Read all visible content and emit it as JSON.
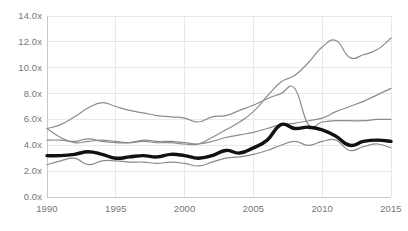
{
  "chart_data": {
    "type": "line",
    "title": "",
    "subtitle": "",
    "xlabel": "",
    "ylabel": "",
    "xlim": [
      1990,
      2015
    ],
    "ylim": [
      0,
      14
    ],
    "grid": true,
    "legend": "none",
    "y_tick_labels": [
      "14.0x",
      "12.0x",
      "10.0x",
      "8.0x",
      "6.0x",
      "4.0x",
      "2.0x",
      "0.0x"
    ],
    "y_tick_values": [
      14,
      12,
      10,
      8,
      6,
      4,
      2,
      0
    ],
    "x_tick_labels": [
      "1990",
      "1995",
      "2000",
      "2005",
      "2010",
      "2015"
    ],
    "x_tick_values": [
      1990,
      1995,
      2000,
      2005,
      2010,
      2015
    ],
    "x": [
      1990,
      1991,
      1992,
      1993,
      1994,
      1995,
      1996,
      1997,
      1998,
      1999,
      2000,
      2001,
      2002,
      2003,
      2004,
      2005,
      2006,
      2007,
      2008,
      2009,
      2010,
      2011,
      2012,
      2013,
      2014,
      2015
    ],
    "series": [
      {
        "name": "series-highest",
        "color": "#8c8c8c",
        "width": 1.2,
        "emphasis": false,
        "values": [
          5.3,
          4.6,
          4.2,
          4.3,
          4.4,
          4.3,
          4.2,
          4.3,
          4.2,
          4.2,
          4.1,
          4.1,
          4.6,
          5.2,
          5.8,
          6.6,
          7.8,
          8.9,
          9.4,
          10.4,
          11.6,
          12.1,
          10.8,
          11.0,
          11.4,
          12.3
        ]
      },
      {
        "name": "series-upper-mid",
        "color": "#8c8c8c",
        "width": 1.2,
        "emphasis": false,
        "values": [
          5.3,
          5.6,
          6.2,
          6.9,
          7.3,
          7.0,
          6.7,
          6.5,
          6.3,
          6.2,
          6.1,
          5.8,
          6.2,
          6.3,
          6.7,
          7.1,
          7.6,
          8.0,
          8.4,
          5.6,
          5.8,
          5.9,
          5.9,
          5.9,
          6.0,
          6.0
        ]
      },
      {
        "name": "series-mid-rising",
        "color": "#8c8c8c",
        "width": 1.2,
        "emphasis": false,
        "values": [
          4.4,
          4.4,
          4.3,
          4.5,
          4.3,
          4.2,
          4.2,
          4.4,
          4.3,
          4.3,
          4.2,
          4.1,
          4.3,
          4.6,
          4.8,
          5.0,
          5.3,
          5.6,
          5.7,
          5.9,
          6.1,
          6.6,
          7.0,
          7.4,
          7.9,
          8.4
        ]
      },
      {
        "name": "series-bold-median",
        "color": "#111111",
        "width": 3.4,
        "emphasis": true,
        "values": [
          3.2,
          3.2,
          3.3,
          3.5,
          3.3,
          3.0,
          3.1,
          3.2,
          3.1,
          3.3,
          3.2,
          3.0,
          3.2,
          3.6,
          3.4,
          3.8,
          4.4,
          5.6,
          5.3,
          5.4,
          5.2,
          4.7,
          4.0,
          4.3,
          4.4,
          4.3
        ]
      },
      {
        "name": "series-lowest",
        "color": "#8c8c8c",
        "width": 1.2,
        "emphasis": false,
        "values": [
          2.5,
          2.8,
          3.0,
          2.5,
          2.8,
          2.8,
          2.7,
          2.7,
          2.6,
          2.7,
          2.6,
          2.4,
          2.7,
          3.0,
          3.1,
          3.3,
          3.6,
          4.0,
          4.3,
          4.0,
          4.3,
          4.4,
          3.6,
          3.9,
          4.1,
          3.8
        ]
      }
    ]
  },
  "axes": {
    "grid_color": "#e8e8e8",
    "axis_line_color": "#c8c8c8",
    "tick_text_color": "#767676"
  }
}
